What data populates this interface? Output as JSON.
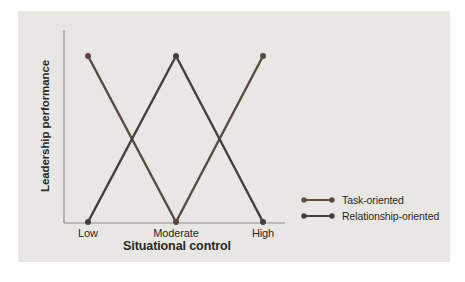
{
  "figure": {
    "panel_background": "#e9e7e3",
    "page_background": "#ffffff",
    "text_color": "#2a2724"
  },
  "chart_data": {
    "type": "line",
    "title": "",
    "categories": [
      "Low",
      "Moderate",
      "High"
    ],
    "xlabel": "Situational control",
    "ylabel": "Leadership performance",
    "ylim": [
      0,
      1
    ],
    "y_ticks": [],
    "grid": false,
    "legend_position": "right-bottom",
    "axis_color": "#8f8d89",
    "series": [
      {
        "name": "Task-oriented",
        "values": [
          1,
          0,
          1
        ],
        "color": "#5a4a42"
      },
      {
        "name": "Relationship-oriented",
        "values": [
          0,
          1,
          0
        ],
        "color": "#443f3c"
      }
    ]
  }
}
